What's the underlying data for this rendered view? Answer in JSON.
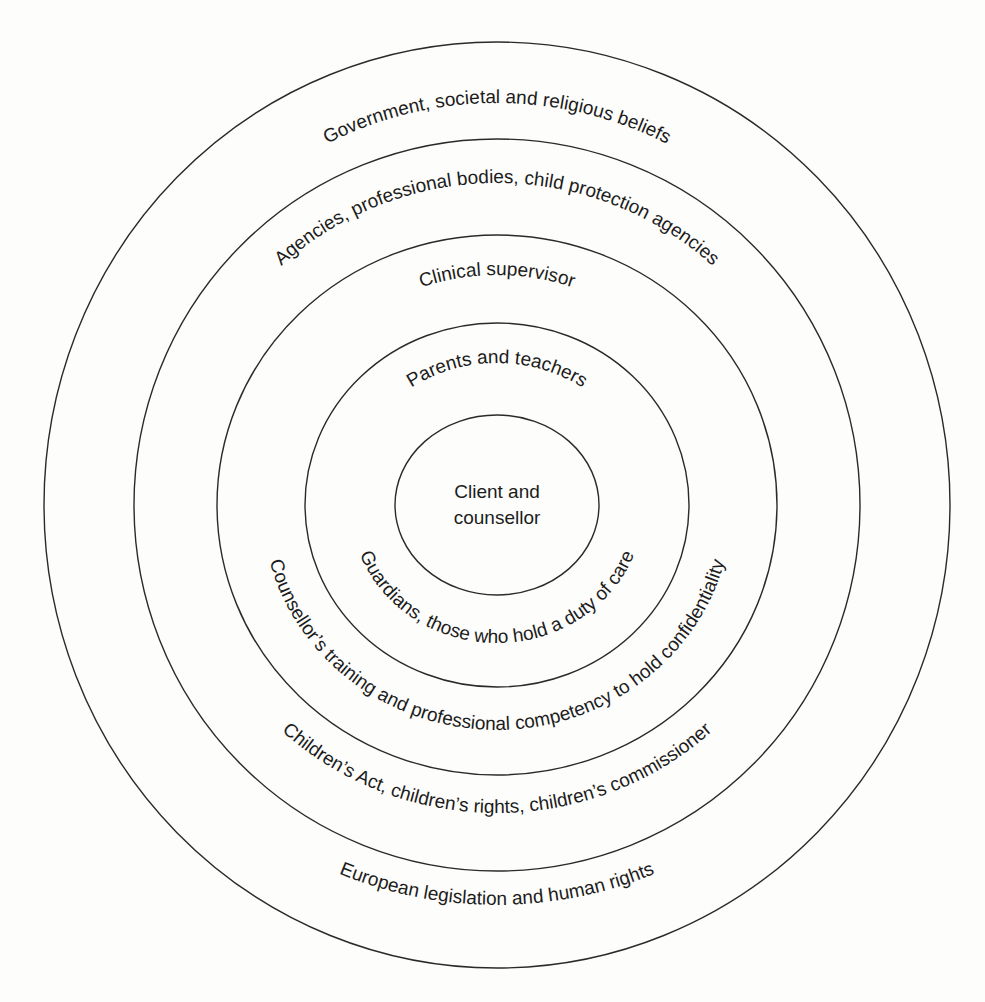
{
  "diagram": {
    "type": "concentric-circles",
    "center": {
      "lines": [
        "Client and",
        "counsellor"
      ]
    },
    "rings_top_labels": [
      "Government, societal and religious beliefs",
      "Agencies, professional bodies, child protection agencies",
      "Clinical supervisor",
      "Parents and teachers"
    ],
    "rings_bottom_labels": [
      "European legislation and human rights",
      "Children’s Act, children’s rights, children’s commissioner",
      "Counsellor’s training and professional competency to hold confidentiality",
      "Guardians, those who hold a duty of care"
    ],
    "stroke_color": "#2a2a2a",
    "text_color": "#1c1c1c",
    "background_color": "#fdfdfb"
  }
}
